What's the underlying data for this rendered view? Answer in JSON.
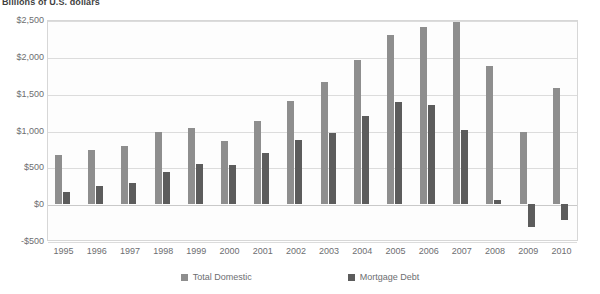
{
  "chart_data": {
    "type": "bar",
    "title": "Billions of U.S. dollars",
    "xlabel": "",
    "ylabel": "",
    "ylim": [
      -500,
      2500
    ],
    "ytick_values": [
      2500,
      2000,
      1500,
      1000,
      500,
      0,
      -500
    ],
    "ytick_labels": [
      "$2,500",
      "$2,000",
      "$1,500",
      "$1,000",
      "$500",
      "$0",
      "-$500"
    ],
    "grid": true,
    "legend_position": "bottom",
    "categories": [
      "1995",
      "1996",
      "1997",
      "1998",
      "1999",
      "2000",
      "2001",
      "2002",
      "2003",
      "2004",
      "2005",
      "2006",
      "2007",
      "2008",
      "2009",
      "2010"
    ],
    "series": [
      {
        "name": "Total Domestic",
        "color": "#8e8e8e",
        "values": [
          670,
          730,
          790,
          980,
          1030,
          860,
          1130,
          1400,
          1660,
          1960,
          2300,
          2410,
          2470,
          1870,
          980,
          1580
        ]
      },
      {
        "name": "Mortgage Debt",
        "color": "#5c5c5c",
        "values": [
          160,
          240,
          290,
          440,
          550,
          530,
          690,
          870,
          960,
          1200,
          1390,
          1350,
          1010,
          60,
          -310,
          -210
        ]
      }
    ]
  },
  "legend": {
    "items": [
      {
        "label": "Total Domestic",
        "key": "total"
      },
      {
        "label": "Mortgage Debt",
        "key": "mortgage"
      }
    ]
  }
}
